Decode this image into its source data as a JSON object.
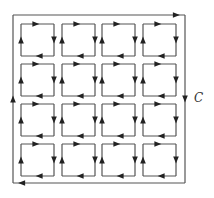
{
  "diagram": {
    "outer_curve": {
      "label": "C",
      "orientation": "clockwise",
      "stroke": "#555555"
    },
    "grid": {
      "rows": 4,
      "cols": 4,
      "cell_orientation": "clockwise"
    },
    "colors": {
      "line": "#555555",
      "arrow": "#222222",
      "background": "#ffffff"
    }
  }
}
